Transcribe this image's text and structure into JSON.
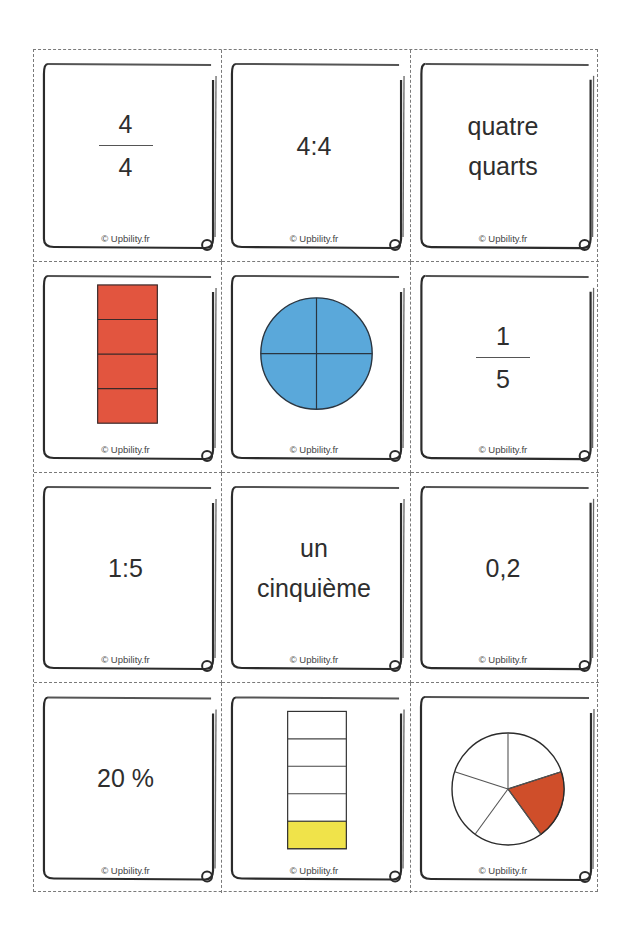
{
  "sheet": {
    "title": "Fraction memory cards",
    "copyright": "© Upbility.fr",
    "colors": {
      "red_bar": "#E2553F",
      "blue_circle": "#5AA8DA",
      "yellow_fill": "#F0E34A",
      "pie_slice": "#CF4E2A",
      "outline": "#2b2b2b"
    }
  },
  "cards": [
    {
      "id": "card-4-over-4",
      "type": "fraction",
      "numerator": "4",
      "denominator": "4",
      "copyright": "© Upbility.fr"
    },
    {
      "id": "card-4-ratio-4",
      "type": "text",
      "lines": [
        "4:4"
      ],
      "copyright": "© Upbility.fr"
    },
    {
      "id": "card-quatre-quarts",
      "type": "text",
      "lines": [
        "quatre",
        "quarts"
      ],
      "copyright": "© Upbility.fr"
    },
    {
      "id": "card-red-bar-4-of-4",
      "type": "bar-diagram",
      "segments": 4,
      "filled": 4,
      "fill_color": "#E2553F",
      "copyright": "© Upbility.fr"
    },
    {
      "id": "card-blue-circle-4-of-4",
      "type": "circle-diagram",
      "segments": 4,
      "filled": 4,
      "fill_color": "#5AA8DA",
      "copyright": "© Upbility.fr"
    },
    {
      "id": "card-1-over-5",
      "type": "fraction",
      "numerator": "1",
      "denominator": "5",
      "copyright": "© Upbility.fr"
    },
    {
      "id": "card-1-ratio-5",
      "type": "text",
      "lines": [
        "1:5"
      ],
      "copyright": "© Upbility.fr"
    },
    {
      "id": "card-un-cinquieme",
      "type": "text",
      "lines": [
        "un",
        "cinquième"
      ],
      "copyright": "© Upbility.fr"
    },
    {
      "id": "card-0-2",
      "type": "text",
      "lines": [
        "0,2"
      ],
      "copyright": "© Upbility.fr"
    },
    {
      "id": "card-20-percent",
      "type": "text",
      "lines": [
        "20 %"
      ],
      "copyright": "© Upbility.fr"
    },
    {
      "id": "card-yellow-bar-1-of-5",
      "type": "bar-diagram",
      "segments": 5,
      "filled": 1,
      "fill_color": "#F0E34A",
      "copyright": "© Upbility.fr"
    },
    {
      "id": "card-pie-1-of-5",
      "type": "pie-diagram",
      "segments": 5,
      "filled": 1,
      "fill_color": "#CF4E2A",
      "copyright": "© Upbility.fr"
    }
  ]
}
